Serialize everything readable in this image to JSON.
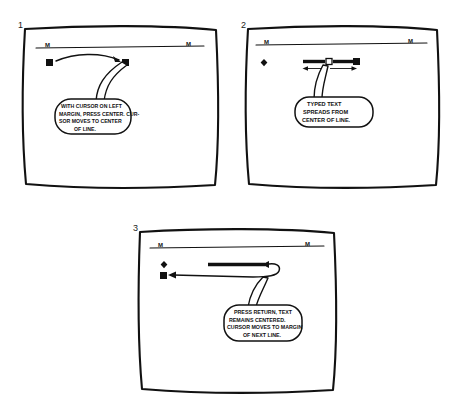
{
  "document": {
    "kind": "hand-drawn instructional storyboard",
    "topic": "Centering text on a screen editor",
    "background_color": "#ffffff",
    "ink_color": "#111111"
  },
  "panels": [
    {
      "number": "1",
      "caption": "WITH CURSOR ON LEFT MARGIN, PRESS CENTER. CURSOR MOVES TO CENTER OF LINE.",
      "caption_lines": [
        "WITH CURSOR ON LEFT",
        "MARGIN, PRESS CENTER. CUR-",
        "SOR MOVES TO CENTER",
        "OF LINE."
      ],
      "ruler": {
        "left_marker": "M",
        "right_marker": "M"
      },
      "elements": [
        {
          "name": "cursor-block-left-margin",
          "shape": "filled-square"
        },
        {
          "name": "cursor-block-center",
          "shape": "filled-square"
        },
        {
          "name": "motion-arrow",
          "shape": "curved-arrow-right"
        }
      ]
    },
    {
      "number": "2",
      "caption": "TYPED TEXT SPREADS FROM CENTER OF LINE.",
      "caption_lines": [
        "TYPED TEXT",
        "SPREADS FROM",
        "CENTER OF LINE."
      ],
      "ruler": {
        "left_marker": "M",
        "right_marker": "M"
      },
      "elements": [
        {
          "name": "margin-stop-diamond",
          "shape": "filled-diamond"
        },
        {
          "name": "typed-text-bar-left",
          "shape": "thick-bar"
        },
        {
          "name": "center-mark",
          "shape": "hollow-square"
        },
        {
          "name": "typed-text-bar-right",
          "shape": "thick-bar"
        },
        {
          "name": "cursor-block",
          "shape": "filled-square"
        },
        {
          "name": "spread-arrow-left",
          "shape": "arrow-left"
        },
        {
          "name": "spread-arrow-right",
          "shape": "arrow-right"
        }
      ]
    },
    {
      "number": "3",
      "caption": "PRESS RETURN, TEXT REMAINS CENTERED. CURSOR MOVES TO MARGIN OF NEXT LINE.",
      "caption_lines": [
        "PRESS RETURN, TEXT",
        "REMAINS CENTERED.",
        "CURSOR MOVES TO MARGIN",
        "OF NEXT LINE."
      ],
      "ruler": {
        "left_marker": "M",
        "right_marker": "M"
      },
      "elements": [
        {
          "name": "margin-stop-diamond",
          "shape": "filled-diamond"
        },
        {
          "name": "centered-text-bar",
          "shape": "thick-bar"
        },
        {
          "name": "return-arrow",
          "shape": "curved-return-arrow"
        },
        {
          "name": "cursor-block-next-line",
          "shape": "filled-square"
        }
      ]
    }
  ]
}
